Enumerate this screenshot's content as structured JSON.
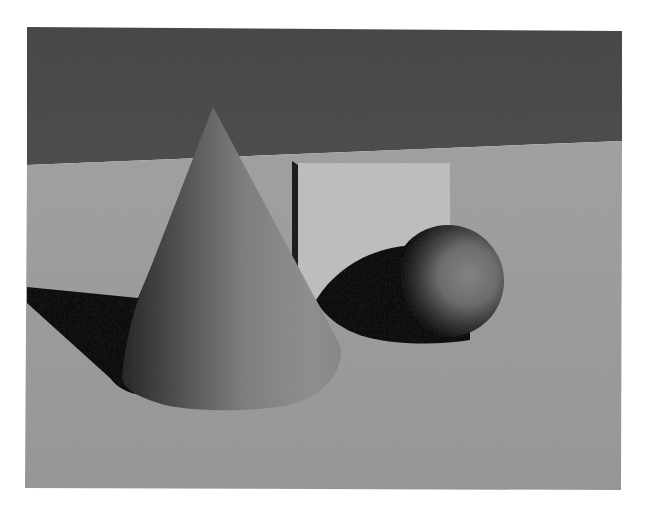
{
  "scene": {
    "description": "3D render of a cone, a cube and a sphere on a floor in front of a dark wall",
    "objects": [
      "cone",
      "cube",
      "sphere"
    ],
    "colors": {
      "page_background": "#ffffff",
      "wall": "#4a4a4a",
      "floor": "#9a9a9a",
      "cube_face": "#bdbdbd",
      "cube_edge": "#1a1a1a",
      "cone_light": "#8e8e8e",
      "cone_dark": "#3a3a3a",
      "sphere_light": "#7a7a7a",
      "shadow": "#0c0c0c"
    }
  }
}
